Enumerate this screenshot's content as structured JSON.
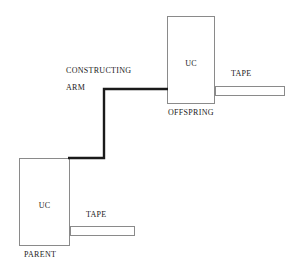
{
  "diagram": {
    "background_color": "#ffffff",
    "line_color": "#8a8a8a",
    "arm_color": "#1a1a1a",
    "text_color": "#1a1a1a"
  },
  "offspring": {
    "box_label": "UC",
    "caption": "OFFSPRING",
    "tape_label": "TAPE",
    "box": {
      "x": 167,
      "y": 16,
      "width": 48,
      "height": 88
    },
    "tape": {
      "x": 215,
      "y": 86,
      "width": 70,
      "height": 10
    }
  },
  "parent": {
    "box_label": "UC",
    "caption": "PARENT",
    "tape_label": "TAPE",
    "box": {
      "x": 19,
      "y": 158,
      "width": 51,
      "height": 88
    },
    "tape": {
      "x": 70,
      "y": 226,
      "width": 65,
      "height": 10
    }
  },
  "constructing_arm": {
    "label_line1": "CONSTRUCTING",
    "label_line2": "ARM",
    "path": "M 68 158 L 104 158 L 104 89 L 168 89",
    "stroke_width": 2.4
  }
}
